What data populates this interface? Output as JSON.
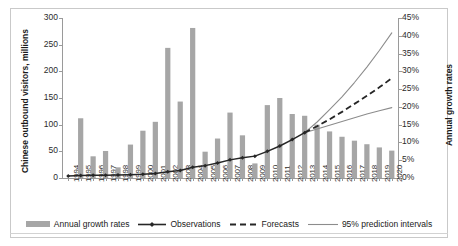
{
  "chart_data": {
    "type": "bar",
    "title": "",
    "subtitle": "",
    "xlabel": "",
    "ylabel": "Chinese outbound visitors, millions",
    "y2label": "Annual growth rates",
    "grid": false,
    "legend_position": "bottom",
    "categories": [
      "1994",
      "1995",
      "1996",
      "1997",
      "1998",
      "1999",
      "2000",
      "2001",
      "2002",
      "2003",
      "2004",
      "2005",
      "2006",
      "2007",
      "2008",
      "2009",
      "2010",
      "2011",
      "2012",
      "2013",
      "2014",
      "2015",
      "2016",
      "2017",
      "2018",
      "2019",
      "2020"
    ],
    "ylim": [
      0,
      300
    ],
    "yticks": [
      "0",
      "50",
      "100",
      "150",
      "200",
      "250",
      "300"
    ],
    "ytick_values": [
      0,
      50,
      100,
      150,
      200,
      250,
      300
    ],
    "y2lim": [
      0,
      0.45
    ],
    "y2ticks": [
      "0%",
      "5%",
      "10%",
      "15%",
      "20%",
      "25%",
      "30%",
      "35%",
      "40%",
      "45%"
    ],
    "y2tick_values": [
      0,
      0.05,
      0.1,
      0.15,
      0.2,
      0.25,
      0.3,
      0.35,
      0.4,
      0.45
    ],
    "series": [
      {
        "name": "Annual growth rates",
        "type": "bar",
        "axis": "right",
        "color": "#a6a6a6",
        "x": [
          "1994",
          "1995",
          "1996",
          "1997",
          "1998",
          "1999",
          "2000",
          "2001",
          "2002",
          "2003",
          "2004",
          "2005",
          "2006",
          "2007",
          "2008",
          "2009",
          "2010",
          "2011",
          "2012",
          "2013",
          "2014",
          "2015",
          "2016",
          "2017",
          "2018",
          "2019",
          "2020"
        ],
        "values": [
          0.0,
          0.168,
          0.061,
          0.076,
          0.03,
          0.094,
          0.133,
          0.158,
          0.366,
          0.215,
          0.422,
          0.074,
          0.111,
          0.184,
          0.12,
          0.041,
          0.205,
          0.225,
          0.18,
          0.175,
          0.15,
          0.131,
          0.116,
          0.105,
          0.095,
          0.086,
          0.077
        ]
      },
      {
        "name": "Observations",
        "type": "line",
        "axis": "left",
        "color": "#262626",
        "marker": "diamond",
        "x": [
          "1994",
          "1995",
          "1996",
          "1997",
          "1998",
          "1999",
          "2000",
          "2001",
          "2002",
          "2003",
          "2004",
          "2005",
          "2006",
          "2007",
          "2008",
          "2009",
          "2010",
          "2011",
          "2012",
          "2013"
        ],
        "values": [
          3.7,
          4.5,
          5.1,
          5.3,
          5.6,
          6.2,
          7.0,
          8.5,
          11.6,
          14.0,
          20.2,
          23.2,
          28.0,
          34.0,
          38.0,
          41.0,
          50.0,
          60.0,
          72.0,
          85.0
        ]
      },
      {
        "name": "Forecasts",
        "type": "line",
        "style": "dashed",
        "axis": "left",
        "color": "#262626",
        "x": [
          "2013",
          "2014",
          "2015",
          "2016",
          "2017",
          "2018",
          "2019",
          "2020"
        ],
        "values": [
          85.0,
          97.0,
          110.0,
          124.0,
          139.0,
          154.0,
          170.0,
          187.0
        ]
      },
      {
        "name": "95% prediction intervals",
        "type": "line",
        "style": "solid-thin",
        "axis": "left",
        "color": "#8c8c8c",
        "bound": "upper",
        "x": [
          "2013",
          "2014",
          "2015",
          "2016",
          "2017",
          "2018",
          "2019",
          "2020"
        ],
        "values": [
          85.0,
          105.0,
          128.0,
          152.0,
          179.0,
          208.0,
          239.0,
          272.0
        ]
      },
      {
        "name": "95% prediction intervals",
        "type": "line",
        "style": "solid-thin",
        "axis": "left",
        "color": "#8c8c8c",
        "bound": "lower",
        "x": [
          "2013",
          "2014",
          "2015",
          "2016",
          "2017",
          "2018",
          "2019",
          "2020"
        ],
        "values": [
          85.0,
          92.0,
          99.0,
          106.0,
          113.0,
          120.0,
          126.0,
          132.0
        ]
      }
    ],
    "legend": [
      {
        "label": "Annual growth rates",
        "marker": "bar",
        "color": "#a6a6a6"
      },
      {
        "label": "Observations",
        "marker": "line-diamond",
        "color": "#262626"
      },
      {
        "label": "Forecasts",
        "marker": "line-dashed",
        "color": "#262626"
      },
      {
        "label": "95% prediction intervals",
        "marker": "line-thin",
        "color": "#8c8c8c"
      }
    ]
  }
}
